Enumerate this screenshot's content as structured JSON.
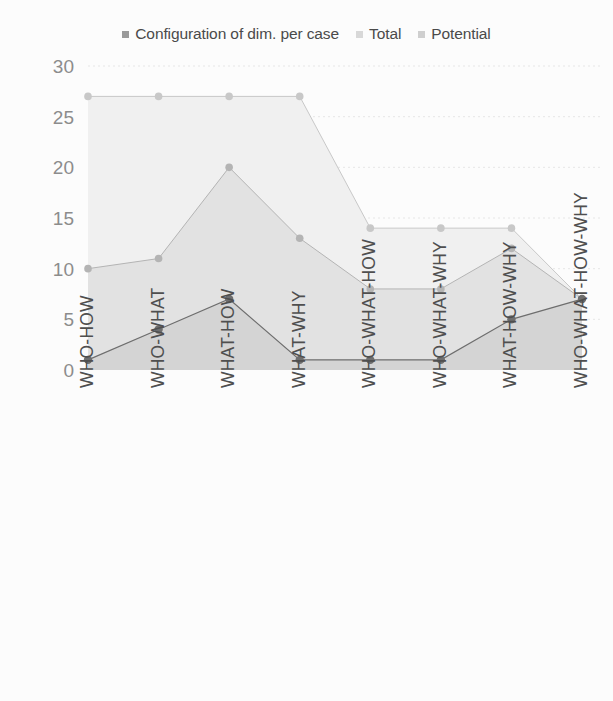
{
  "legend": {
    "position": "top",
    "entries": [
      {
        "label": "Configuration of dim. per case",
        "color": "#9a9a9a",
        "marker": "legend-swatch-square"
      },
      {
        "label": "Total",
        "color": "#d8d8d8",
        "marker": "legend-swatch-square"
      },
      {
        "label": "Potential",
        "color": "#cfcfcf",
        "marker": "legend-swatch-square"
      }
    ]
  },
  "axes": {
    "y_ticks": [
      "0",
      "5",
      "10",
      "15",
      "20",
      "25",
      "30"
    ],
    "x_ticks": [
      "WHO-HOW",
      "WHO-WHAT",
      "WHAT-HOW",
      "WHAT-WHY",
      "WHO-WHAT-HOW",
      "WHO-WHAT-WHY",
      "WHAT-HOW-WHY",
      "WHO-WHAT-HOW-WHY"
    ]
  },
  "colors": {
    "background": "#fcfcfc",
    "gridline": "#e6e6e6",
    "total_fill": "#f0f0f0",
    "potential_fill": "#e2e2e2",
    "configuration_fill": "#d4d4d4",
    "total_marker": "#c8c8c8",
    "potential_marker": "#b4b4b4",
    "configuration_marker": "#6e6e6e",
    "y_label": "#8c8c8c",
    "x_label": "#4f4f4f",
    "legend_label": "#4a4a4a"
  },
  "chart_data": {
    "type": "area",
    "title": "",
    "subtitle": "",
    "xlabel": "",
    "ylabel": "",
    "ylim": [
      0,
      30
    ],
    "ytick_step": 5,
    "grid": true,
    "legend_position": "top",
    "stacked": false,
    "categories": [
      "WHO-HOW",
      "WHO-WHAT",
      "WHAT-HOW",
      "WHAT-WHY",
      "WHO-WHAT-HOW",
      "WHO-WHAT-WHY",
      "WHAT-HOW-WHY",
      "WHO-WHAT-HOW-WHY"
    ],
    "series": [
      {
        "name": "Total",
        "values": [
          27,
          27,
          27,
          27,
          14,
          14,
          14,
          7
        ],
        "fill": "#f0f0f0",
        "marker_color": "#c8c8c8"
      },
      {
        "name": "Potential",
        "values": [
          10,
          11,
          20,
          13,
          8,
          8,
          12,
          7
        ],
        "fill": "#e2e2e2",
        "marker_color": "#b4b4b4"
      },
      {
        "name": "Configuration of dim. per case",
        "values": [
          1,
          4,
          7,
          1,
          1,
          1,
          5,
          7
        ],
        "fill": "#d4d4d4",
        "marker_color": "#6e6e6e"
      }
    ]
  }
}
